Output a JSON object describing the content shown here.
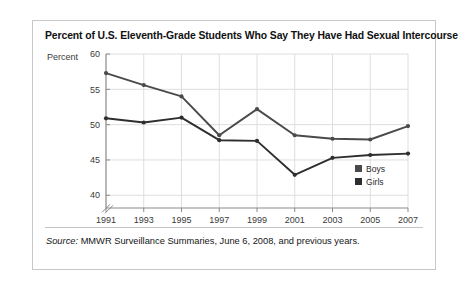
{
  "figure": {
    "title": "Percent of U.S. Eleventh-Grade Students Who Say They Have Had Sexual Intercourse",
    "source_prefix": "Source:",
    "source_text": " MMWR Surveillance Summaries, June 6, 2008, and previous years."
  },
  "chart_data": {
    "type": "line",
    "title": "Percent of U.S. Eleventh-Grade Students Who Say They Have Had Sexual Intercourse",
    "xlabel": "Year",
    "ylabel": "Percent",
    "categories": [
      "1991",
      "1993",
      "1995",
      "1997",
      "1999",
      "2001",
      "2003",
      "2005",
      "2007"
    ],
    "x": [
      1991,
      1993,
      1995,
      1997,
      1999,
      2001,
      2003,
      2005,
      2007
    ],
    "series": [
      {
        "name": "Boys",
        "color": "#4a4a4a",
        "values": [
          57.3,
          55.6,
          54.0,
          48.5,
          52.2,
          48.5,
          48.0,
          47.9,
          49.8
        ]
      },
      {
        "name": "Girls",
        "color": "#2e2e2e",
        "values": [
          50.9,
          50.3,
          51.0,
          47.8,
          47.7,
          42.9,
          45.3,
          45.7,
          45.9
        ]
      }
    ],
    "ylim": [
      38.2,
      60
    ],
    "yticks": [
      40,
      45,
      50,
      55,
      60
    ],
    "ytick_labels": [
      "40",
      "45",
      "50",
      "55",
      "60"
    ],
    "grid": true,
    "axis_break": true,
    "legend_position": "right"
  },
  "legend": {
    "items": [
      {
        "label": "Boys",
        "color": "#4a4a4a"
      },
      {
        "label": "Girls",
        "color": "#2e2e2e"
      }
    ]
  }
}
